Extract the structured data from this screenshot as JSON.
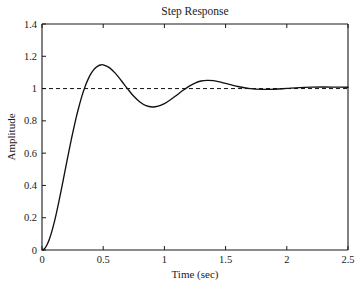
{
  "chart_data": {
    "type": "line",
    "title": "Step Response",
    "xlabel": "Time (sec)",
    "ylabel": "Amplitude",
    "xlim": [
      0,
      2.5
    ],
    "ylim": [
      0,
      1.4
    ],
    "grid": false,
    "legend": null,
    "xticks": [
      "0",
      "0.5",
      "1",
      "1.5",
      "2",
      "2.5"
    ],
    "xtick_values": [
      0,
      0.5,
      1,
      1.5,
      2,
      2.5
    ],
    "yticks": [
      "0",
      "0.2",
      "0.4",
      "0.6",
      "0.8",
      "1",
      "1.2",
      "1.4"
    ],
    "ytick_values": [
      0,
      0.2,
      0.4,
      0.6,
      0.8,
      1,
      1.2,
      1.4
    ],
    "series": [
      {
        "name": "step-response",
        "style": "solid",
        "color": "#111111",
        "x": [
          0,
          0.02,
          0.04,
          0.06,
          0.08,
          0.1,
          0.12,
          0.14,
          0.16,
          0.18,
          0.2,
          0.22,
          0.24,
          0.26,
          0.28,
          0.3,
          0.32,
          0.34,
          0.36,
          0.38,
          0.4,
          0.42,
          0.44,
          0.46,
          0.48,
          0.5,
          0.55,
          0.6,
          0.65,
          0.7,
          0.75,
          0.8,
          0.85,
          0.9,
          0.95,
          1.0,
          1.05,
          1.1,
          1.15,
          1.2,
          1.25,
          1.3,
          1.35,
          1.4,
          1.45,
          1.5,
          1.6,
          1.7,
          1.8,
          1.9,
          2.0,
          2.1,
          2.2,
          2.3,
          2.4,
          2.5
        ],
        "y": [
          0,
          0.008,
          0.031,
          0.067,
          0.114,
          0.171,
          0.236,
          0.307,
          0.382,
          0.459,
          0.536,
          0.613,
          0.687,
          0.757,
          0.823,
          0.883,
          0.938,
          0.986,
          1.028,
          1.063,
          1.092,
          1.114,
          1.13,
          1.141,
          1.146,
          1.147,
          1.13,
          1.094,
          1.047,
          0.998,
          0.952,
          0.917,
          0.894,
          0.886,
          0.891,
          0.907,
          0.931,
          0.959,
          0.988,
          1.014,
          1.034,
          1.047,
          1.051,
          1.049,
          1.042,
          1.032,
          1.013,
          1.0,
          0.995,
          0.996,
          1.001,
          1.006,
          1.009,
          1.01,
          1.009,
          1.008
        ]
      },
      {
        "name": "steady-state-reference",
        "style": "dashed",
        "color": "#111111",
        "x": [
          0,
          2.5
        ],
        "y": [
          1.0,
          1.0
        ]
      }
    ],
    "annotations": {
      "peak_overshoot_value": 1.22,
      "peak_overshoot_time": 0.42,
      "undershoot_value": 0.91,
      "undershoot_time": 0.82,
      "second_peak_value": 1.03,
      "second_peak_time": 1.27,
      "steady_state_value": 1.01
    }
  }
}
